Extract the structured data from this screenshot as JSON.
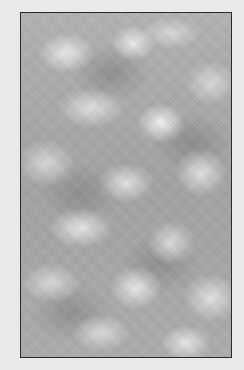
{
  "image": {
    "subject": "cloud-texture",
    "description": "Grayscale cloud/noise texture inside a thin dark rectangular frame",
    "colors": {
      "background": "#e9e9e9",
      "frame_border": "#2a2a2a",
      "texture_base": "#a9a9a9",
      "texture_highlight": "#f0f0f0"
    }
  }
}
